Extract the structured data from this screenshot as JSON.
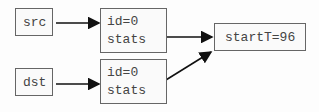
{
  "nodes": {
    "src": {
      "label": "src"
    },
    "dst": {
      "label": "dst"
    },
    "obj_top": {
      "id_label": "id=0",
      "field_label": "stats"
    },
    "obj_bottom": {
      "id_label": "id=0",
      "field_label": "stats"
    },
    "stats": {
      "label": "startT=96"
    }
  },
  "edges": [
    {
      "from": "src",
      "to": "obj_top"
    },
    {
      "from": "dst",
      "to": "obj_bottom"
    },
    {
      "from": "obj_top.stats",
      "to": "stats"
    },
    {
      "from": "obj_bottom.stats",
      "to": "stats"
    }
  ],
  "colors": {
    "stroke": "#666666",
    "arrow": "#111111",
    "text": "#444444"
  }
}
